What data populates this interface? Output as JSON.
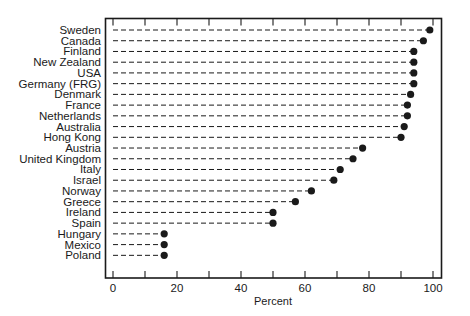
{
  "chart_data": {
    "type": "dot",
    "title": "",
    "xlabel": "Percent",
    "ylabel": "",
    "xlim": [
      0,
      100
    ],
    "xticks": [
      0,
      10,
      20,
      30,
      40,
      50,
      60,
      70,
      80,
      90,
      100
    ],
    "xtick_labels": [
      "0",
      "20",
      "40",
      "60",
      "80",
      "100"
    ],
    "xtick_label_values": [
      0,
      20,
      40,
      60,
      80,
      100
    ],
    "grid": false,
    "legend": null,
    "line_style": "dashed leader from 0 to value",
    "marker_color": "#1a1a1a",
    "categories": [
      "Sweden",
      "Canada",
      "Finland",
      "New Zealand",
      "USA",
      "Germany (FRG)",
      "Denmark",
      "France",
      "Netherlands",
      "Australia",
      "Hong Kong",
      "Austria",
      "United Kingdom",
      "Italy",
      "Israel",
      "Norway",
      "Greece",
      "Ireland",
      "Spain",
      "Hungary",
      "Mexico",
      "Poland"
    ],
    "values": [
      99,
      97,
      94,
      94,
      94,
      94,
      93,
      92,
      92,
      91,
      90,
      78,
      75,
      71,
      69,
      62,
      57,
      50,
      50,
      16,
      16,
      16
    ]
  }
}
